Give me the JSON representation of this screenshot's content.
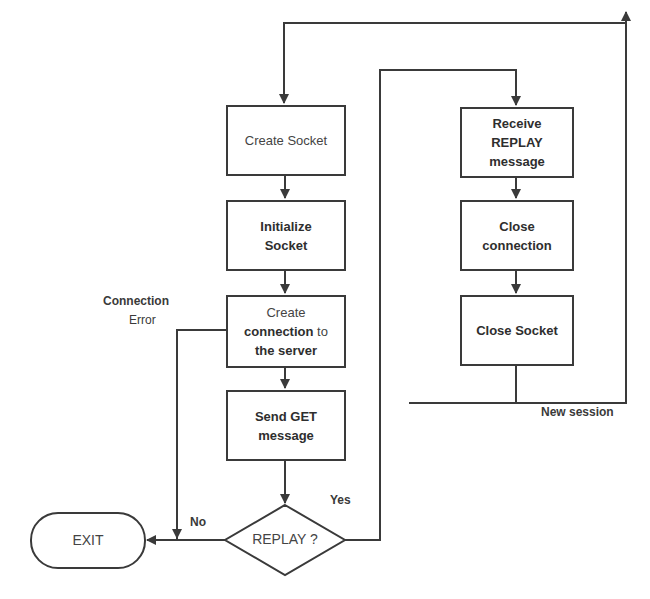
{
  "diagram": {
    "type": "flowchart",
    "nodes": {
      "create_socket": "Create Socket",
      "initialize_socket": [
        "Initialize",
        "Socket"
      ],
      "create_connection": {
        "line1": "Create",
        "bold": "connection",
        "after": " to",
        "line3": "the server"
      },
      "send_get": [
        "Send GET",
        "message"
      ],
      "replay_decision": "REPLAY ?",
      "exit": "EXIT",
      "receive_replay": [
        "Receive",
        "REPLAY",
        "message"
      ],
      "close_connection": [
        "Close",
        "connection"
      ],
      "close_socket": "Close Socket"
    },
    "edge_labels": {
      "connection_error_title": "Connection",
      "connection_error_sub": "Error",
      "no": "No",
      "yes": "Yes",
      "new_session": "New session"
    },
    "colors": {
      "stroke": "#3a3a3a",
      "background": "#ffffff"
    }
  }
}
